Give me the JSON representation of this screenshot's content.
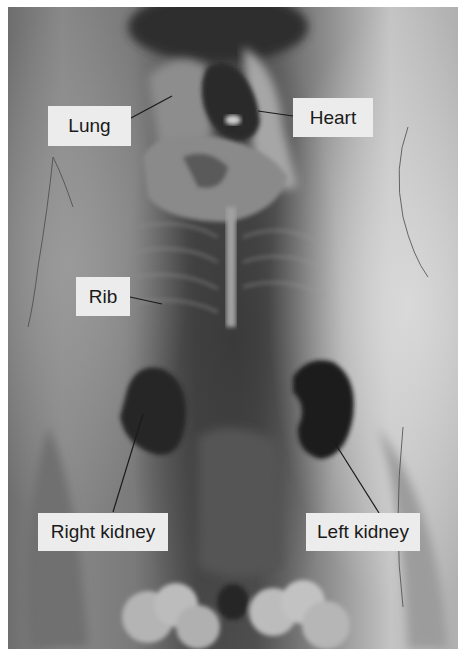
{
  "figure": {
    "type": "grayscale anatomical dissection photograph",
    "labels": [
      {
        "id": "lung",
        "text": "Lung"
      },
      {
        "id": "heart",
        "text": "Heart"
      },
      {
        "id": "rib",
        "text": "Rib"
      },
      {
        "id": "right-kidney",
        "text": "Right kidney"
      },
      {
        "id": "left-kidney",
        "text": "Left kidney"
      }
    ]
  }
}
